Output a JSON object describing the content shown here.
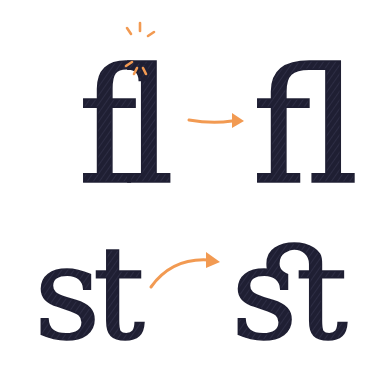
{
  "illustration": {
    "title": "Ligature illustration",
    "ink_color": "#1f1f33",
    "accent_color": "#f29a52",
    "background": "#ffffff",
    "rows": [
      {
        "name": "fl-ligature",
        "before": "fl",
        "after": "ﬂ",
        "arrow": "straight",
        "highlight": "collision-sparks"
      },
      {
        "name": "st-ligature",
        "before": "st",
        "after": "ﬆ",
        "arrow": "curved"
      }
    ]
  }
}
